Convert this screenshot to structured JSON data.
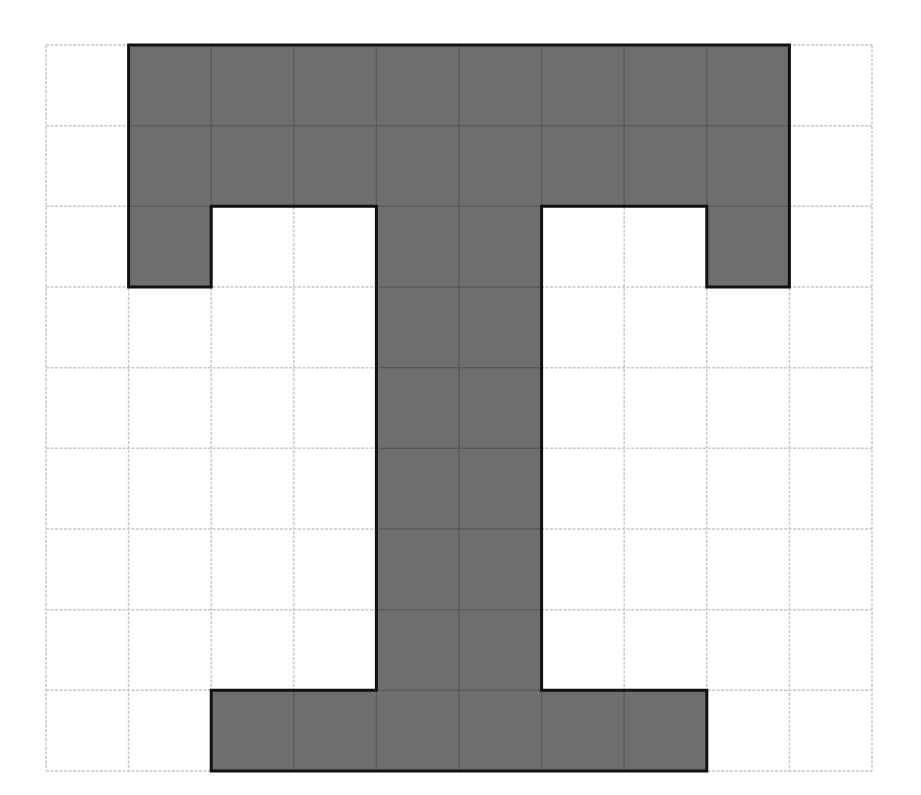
{
  "diagram": {
    "grid": {
      "cols": 10,
      "rows": 9,
      "left": 46,
      "top": 45,
      "right": 872,
      "bottom": 771,
      "line_color": "#c8c8c8",
      "line_style": "dashed"
    },
    "shape": {
      "fill": "#6e6e6e",
      "stroke": "#111111",
      "stroke_width": 3,
      "inner_line_color": "#5a5a5a",
      "filled_cells": [
        [
          0,
          1
        ],
        [
          0,
          2
        ],
        [
          0,
          3
        ],
        [
          0,
          4
        ],
        [
          0,
          5
        ],
        [
          0,
          6
        ],
        [
          0,
          7
        ],
        [
          0,
          8
        ],
        [
          1,
          1
        ],
        [
          1,
          2
        ],
        [
          1,
          3
        ],
        [
          1,
          4
        ],
        [
          1,
          5
        ],
        [
          1,
          6
        ],
        [
          1,
          7
        ],
        [
          1,
          8
        ],
        [
          2,
          1
        ],
        [
          2,
          4
        ],
        [
          2,
          5
        ],
        [
          2,
          8
        ],
        [
          3,
          4
        ],
        [
          3,
          5
        ],
        [
          4,
          4
        ],
        [
          4,
          5
        ],
        [
          5,
          4
        ],
        [
          5,
          5
        ],
        [
          6,
          4
        ],
        [
          6,
          5
        ],
        [
          7,
          4
        ],
        [
          7,
          5
        ],
        [
          8,
          2
        ],
        [
          8,
          3
        ],
        [
          8,
          4
        ],
        [
          8,
          5
        ],
        [
          8,
          6
        ],
        [
          8,
          7
        ]
      ],
      "outline": [
        [
          1,
          0
        ],
        [
          9,
          0
        ],
        [
          9,
          3
        ],
        [
          8,
          3
        ],
        [
          8,
          2
        ],
        [
          6,
          2
        ],
        [
          6,
          8
        ],
        [
          8,
          8
        ],
        [
          8,
          9
        ],
        [
          2,
          9
        ],
        [
          2,
          8
        ],
        [
          4,
          8
        ],
        [
          4,
          2
        ],
        [
          2,
          2
        ],
        [
          2,
          3
        ],
        [
          1,
          3
        ]
      ],
      "filled_cell_count": 36
    }
  }
}
